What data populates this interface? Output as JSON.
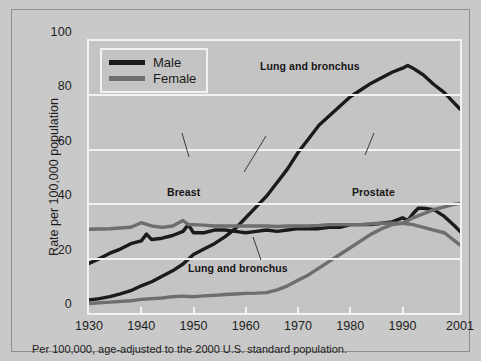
{
  "figure": {
    "caption": "Per 100,000, age-adjusted to the 2000 U.S. standard population."
  },
  "legend": {
    "items": [
      {
        "label": "Male",
        "color": "#1b1b1b"
      },
      {
        "label": "Female",
        "color": "#6e6e6e"
      }
    ]
  },
  "annotations": {
    "male_lung": "Lung and bronchus",
    "female_lung": "Lung and bronchus",
    "breast": "Breast",
    "prostate": "Prostate"
  },
  "chart_data": {
    "type": "line",
    "title": "",
    "xlabel": "",
    "ylabel": "Rate per 100,000 population",
    "xlim": [
      1930,
      2001
    ],
    "ylim": [
      0,
      100
    ],
    "xticks": [
      1930,
      1940,
      1950,
      1960,
      1970,
      1980,
      1990,
      2001
    ],
    "yticks": [
      0,
      20,
      40,
      60,
      80,
      100
    ],
    "grid": "horizontal",
    "legend_position": "top-left",
    "series": [
      {
        "name": "Lung and bronchus",
        "sex": "Male",
        "color": "#1b1b1b",
        "x": [
          1930,
          1932,
          1934,
          1936,
          1938,
          1940,
          1942,
          1944,
          1946,
          1948,
          1950,
          1952,
          1954,
          1956,
          1958,
          1960,
          1962,
          1964,
          1966,
          1968,
          1970,
          1972,
          1974,
          1976,
          1978,
          1980,
          1982,
          1984,
          1986,
          1988,
          1990,
          1991,
          1992,
          1994,
          1996,
          1998,
          2000,
          2001
        ],
        "values": [
          4.8,
          5.3,
          6.0,
          7.0,
          8.2,
          10.0,
          11.5,
          13.5,
          15.5,
          18.0,
          21.5,
          23.5,
          25.5,
          28.0,
          31.0,
          35.0,
          39.0,
          43.0,
          48.0,
          53.0,
          59.0,
          64.0,
          69.0,
          72.5,
          76.0,
          79.5,
          82.0,
          84.5,
          86.5,
          88.5,
          90.0,
          91.0,
          90.0,
          87.5,
          84.0,
          81.0,
          77.0,
          75.0
        ]
      },
      {
        "name": "Prostate",
        "sex": "Male",
        "color": "#1b1b1b",
        "x": [
          1930,
          1932,
          1934,
          1936,
          1938,
          1940,
          1941,
          1942,
          1944,
          1946,
          1948,
          1949,
          1950,
          1952,
          1954,
          1956,
          1958,
          1960,
          1962,
          1964,
          1966,
          1968,
          1970,
          1972,
          1974,
          1976,
          1978,
          1980,
          1982,
          1984,
          1986,
          1988,
          1990,
          1991,
          1992,
          1993,
          1994,
          1996,
          1998,
          2000,
          2001
        ],
        "values": [
          18.2,
          20.0,
          22.0,
          23.5,
          25.5,
          26.5,
          29.0,
          27.0,
          27.5,
          28.5,
          30.0,
          32.5,
          29.5,
          29.5,
          30.5,
          30.5,
          30.0,
          29.5,
          30.0,
          30.5,
          30.0,
          30.5,
          31.0,
          31.0,
          31.0,
          31.5,
          31.5,
          32.5,
          32.5,
          32.5,
          33.0,
          33.5,
          35.0,
          34.0,
          36.5,
          38.5,
          38.5,
          38.0,
          35.5,
          32.0,
          30.0
        ]
      },
      {
        "name": "Breast",
        "sex": "Female",
        "color": "#6e6e6e",
        "x": [
          1930,
          1934,
          1938,
          1940,
          1942,
          1944,
          1946,
          1948,
          1949,
          1950,
          1952,
          1954,
          1956,
          1958,
          1960,
          1962,
          1964,
          1966,
          1968,
          1970,
          1972,
          1974,
          1976,
          1978,
          1980,
          1982,
          1984,
          1986,
          1988,
          1990,
          1992,
          1994,
          1996,
          1998,
          2000,
          2001
        ],
        "values": [
          30.8,
          31.0,
          31.5,
          33.2,
          32.0,
          31.5,
          32.0,
          34.0,
          32.5,
          32.5,
          32.3,
          32.0,
          32.0,
          32.0,
          32.0,
          32.0,
          32.0,
          31.8,
          32.0,
          32.0,
          32.0,
          32.2,
          32.5,
          32.5,
          32.5,
          32.5,
          32.8,
          33.0,
          33.0,
          33.0,
          32.5,
          31.5,
          30.5,
          29.5,
          26.5,
          25.0
        ]
      },
      {
        "name": "Lung and bronchus",
        "sex": "Female",
        "color": "#6e6e6e",
        "x": [
          1930,
          1934,
          1938,
          1940,
          1944,
          1946,
          1948,
          1950,
          1952,
          1954,
          1956,
          1958,
          1960,
          1962,
          1964,
          1966,
          1968,
          1970,
          1972,
          1974,
          1976,
          1978,
          1980,
          1982,
          1984,
          1986,
          1988,
          1990,
          1992,
          1994,
          1996,
          1998,
          2000,
          2001
        ],
        "values": [
          3.5,
          4.0,
          4.5,
          5.0,
          5.5,
          6.0,
          6.2,
          6.0,
          6.3,
          6.5,
          6.8,
          7.0,
          7.2,
          7.3,
          7.5,
          8.5,
          10.0,
          12.0,
          14.0,
          16.5,
          19.0,
          21.5,
          24.0,
          26.5,
          29.0,
          31.0,
          32.5,
          33.0,
          35.0,
          36.5,
          38.0,
          39.0,
          40.0,
          40.3
        ]
      }
    ]
  }
}
